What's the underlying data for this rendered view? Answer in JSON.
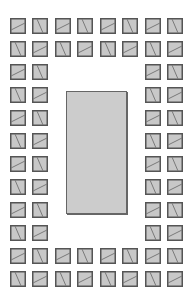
{
  "canvas": {
    "width": 193,
    "height": 300,
    "background": "#ffffff"
  },
  "colors": {
    "tile_fill": "#c8c8c8",
    "tile_border": "#555555",
    "tile_line": "#7a7a7a",
    "rect_fill": "#cccccc",
    "rect_border": "#666666"
  },
  "grid": {
    "cols": 8,
    "rows": 12,
    "col_x": [
      10,
      32,
      55,
      77,
      100,
      122,
      145,
      167
    ],
    "row_y": [
      18,
      41,
      64,
      87,
      110,
      133,
      156,
      179,
      202,
      225,
      248,
      271
    ],
    "tile_size": 16,
    "layout": "ring: rows 1-2 and 11-12 full (8 tiles), rows 3-10 only two outer columns on each side",
    "pattern": "checkerboard: (row+col) even = shallow-rising diagonal, odd = steep-falling diagonal"
  },
  "center_rect": {
    "x": 66,
    "y": 91,
    "width": 61,
    "height": 123
  }
}
